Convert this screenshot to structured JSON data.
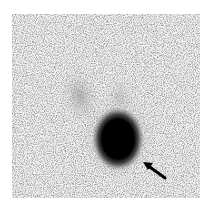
{
  "image": {
    "kind": "grayscale scintigraphy scan",
    "background": "#ffffff",
    "field_color": "#f2f2f2",
    "hot_spot_color": "#000000"
  },
  "annotations": [
    {
      "type": "arrow",
      "color": "#000000",
      "tip": [
        143,
        162
      ],
      "tail": [
        165,
        178
      ]
    }
  ]
}
